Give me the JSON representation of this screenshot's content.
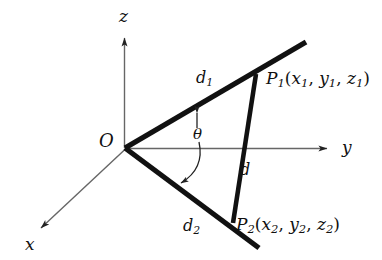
{
  "figure": {
    "type": "3d-coordinate-diagram",
    "background_color": "#ffffff",
    "line_color": "#111111",
    "axis_color": "#555555"
  },
  "axes": {
    "x_label": "x",
    "y_label": "y",
    "z_label": "z",
    "origin_label": "O"
  },
  "segments": {
    "d1_label": "d",
    "d1_sub": "1",
    "d2_label": "d",
    "d2_sub": "2",
    "d_label": "d"
  },
  "angle": {
    "theta_label": "θ"
  },
  "points": {
    "p1": {
      "name": "P",
      "sub": "1",
      "open_paren": "(",
      "coord_x": "x",
      "coord_x_sub": "1",
      "comma1": ", ",
      "coord_y": "y",
      "coord_y_sub": "1",
      "comma2": ", ",
      "coord_z": "z",
      "coord_z_sub": "1",
      "close_paren": ")"
    },
    "p2": {
      "name": "P",
      "sub": "2",
      "open_paren": "(",
      "coord_x": "x",
      "coord_x_sub": "2",
      "comma1": ", ",
      "coord_y": "y",
      "coord_y_sub": "2",
      "comma2": ", ",
      "coord_z": "z",
      "coord_z_sub": "2",
      "close_paren": ")"
    }
  }
}
